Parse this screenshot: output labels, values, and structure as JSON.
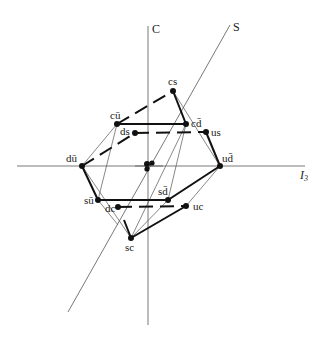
{
  "diagram": {
    "type": "meson weight diagram (SU(4) 16-plet)",
    "axes": {
      "c_label": "C",
      "s_label": "S",
      "i3_label": "I",
      "i3_sub": "3"
    },
    "points": [
      {
        "id": "cs",
        "label": "cs̄",
        "x": 173,
        "y": 91
      },
      {
        "id": "cu",
        "label": "cū",
        "x": 117,
        "y": 124
      },
      {
        "id": "cd",
        "label": "cd̄",
        "x": 186,
        "y": 124
      },
      {
        "id": "ds",
        "label": "ds̄",
        "x": 135,
        "y": 133
      },
      {
        "id": "us",
        "label": "us̄",
        "x": 206,
        "y": 132
      },
      {
        "id": "du",
        "label": "dū",
        "x": 82,
        "y": 166
      },
      {
        "id": "ud",
        "label": "ud̄",
        "x": 220,
        "y": 166
      },
      {
        "id": "su",
        "label": "sū",
        "x": 98,
        "y": 200
      },
      {
        "id": "sd",
        "label": "sd̄",
        "x": 168,
        "y": 200
      },
      {
        "id": "dc",
        "label": "dc̄",
        "x": 118,
        "y": 207
      },
      {
        "id": "uc",
        "label": "uc̄",
        "x": 186,
        "y": 206
      },
      {
        "id": "sc",
        "label": "sc̄",
        "x": 131,
        "y": 238
      }
    ],
    "labels": {
      "cs": "cs",
      "cu": "cū",
      "cd": "cd̄",
      "ds": "ds",
      "us": "us",
      "du": "dū",
      "ud": "ud̄",
      "su": "sū",
      "sd": "sd̄",
      "dc": "dc",
      "uc": "uc",
      "sc": "sc"
    }
  }
}
